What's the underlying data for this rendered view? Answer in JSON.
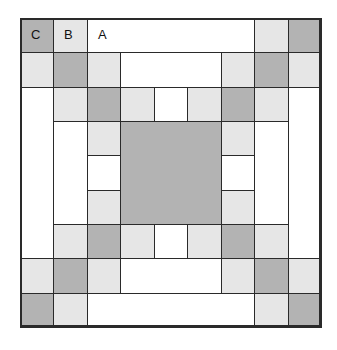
{
  "colors": {
    "dark": "#b3b3b3",
    "light": "#e6e6e6",
    "white": "#ffffff",
    "line": "#2a2a2a"
  },
  "grid": {
    "cols": 9,
    "rows": 9,
    "origin_x": 20,
    "origin_y": 18,
    "cell_w": 33.45,
    "cell_h": 34.33
  },
  "labels": {
    "C": "C",
    "B": "B",
    "A": "A"
  },
  "pieces": [
    {
      "c": 0,
      "r": 0,
      "w": 1,
      "h": 1,
      "t": "dark",
      "label": "C"
    },
    {
      "c": 1,
      "r": 0,
      "w": 1,
      "h": 1,
      "t": "light",
      "label": "B"
    },
    {
      "c": 2,
      "r": 0,
      "w": 5,
      "h": 1,
      "t": "white",
      "label": "A"
    },
    {
      "c": 7,
      "r": 0,
      "w": 1,
      "h": 1,
      "t": "light"
    },
    {
      "c": 8,
      "r": 0,
      "w": 1,
      "h": 1,
      "t": "dark"
    },
    {
      "c": 0,
      "r": 1,
      "w": 1,
      "h": 1,
      "t": "light"
    },
    {
      "c": 1,
      "r": 1,
      "w": 1,
      "h": 1,
      "t": "dark"
    },
    {
      "c": 2,
      "r": 1,
      "w": 1,
      "h": 1,
      "t": "light"
    },
    {
      "c": 3,
      "r": 1,
      "w": 3,
      "h": 1,
      "t": "white"
    },
    {
      "c": 6,
      "r": 1,
      "w": 1,
      "h": 1,
      "t": "light"
    },
    {
      "c": 7,
      "r": 1,
      "w": 1,
      "h": 1,
      "t": "dark"
    },
    {
      "c": 8,
      "r": 1,
      "w": 1,
      "h": 1,
      "t": "light"
    },
    {
      "c": 0,
      "r": 2,
      "w": 1,
      "h": 5,
      "t": "white"
    },
    {
      "c": 8,
      "r": 2,
      "w": 1,
      "h": 5,
      "t": "white"
    },
    {
      "c": 1,
      "r": 2,
      "w": 1,
      "h": 1,
      "t": "light"
    },
    {
      "c": 2,
      "r": 2,
      "w": 1,
      "h": 1,
      "t": "dark"
    },
    {
      "c": 3,
      "r": 2,
      "w": 1,
      "h": 1,
      "t": "light"
    },
    {
      "c": 4,
      "r": 2,
      "w": 1,
      "h": 1,
      "t": "white"
    },
    {
      "c": 5,
      "r": 2,
      "w": 1,
      "h": 1,
      "t": "light"
    },
    {
      "c": 6,
      "r": 2,
      "w": 1,
      "h": 1,
      "t": "dark"
    },
    {
      "c": 7,
      "r": 2,
      "w": 1,
      "h": 1,
      "t": "light"
    },
    {
      "c": 1,
      "r": 3,
      "w": 1,
      "h": 3,
      "t": "white"
    },
    {
      "c": 7,
      "r": 3,
      "w": 1,
      "h": 3,
      "t": "white"
    },
    {
      "c": 2,
      "r": 3,
      "w": 1,
      "h": 1,
      "t": "light"
    },
    {
      "c": 2,
      "r": 4,
      "w": 1,
      "h": 1,
      "t": "white"
    },
    {
      "c": 2,
      "r": 5,
      "w": 1,
      "h": 1,
      "t": "light"
    },
    {
      "c": 3,
      "r": 3,
      "w": 3,
      "h": 3,
      "t": "dark"
    },
    {
      "c": 6,
      "r": 3,
      "w": 1,
      "h": 1,
      "t": "light"
    },
    {
      "c": 6,
      "r": 4,
      "w": 1,
      "h": 1,
      "t": "white"
    },
    {
      "c": 6,
      "r": 5,
      "w": 1,
      "h": 1,
      "t": "light"
    },
    {
      "c": 1,
      "r": 6,
      "w": 1,
      "h": 1,
      "t": "light"
    },
    {
      "c": 2,
      "r": 6,
      "w": 1,
      "h": 1,
      "t": "dark"
    },
    {
      "c": 3,
      "r": 6,
      "w": 1,
      "h": 1,
      "t": "light"
    },
    {
      "c": 4,
      "r": 6,
      "w": 1,
      "h": 1,
      "t": "white"
    },
    {
      "c": 5,
      "r": 6,
      "w": 1,
      "h": 1,
      "t": "light"
    },
    {
      "c": 6,
      "r": 6,
      "w": 1,
      "h": 1,
      "t": "dark"
    },
    {
      "c": 7,
      "r": 6,
      "w": 1,
      "h": 1,
      "t": "light"
    },
    {
      "c": 0,
      "r": 7,
      "w": 1,
      "h": 1,
      "t": "light"
    },
    {
      "c": 1,
      "r": 7,
      "w": 1,
      "h": 1,
      "t": "dark"
    },
    {
      "c": 2,
      "r": 7,
      "w": 1,
      "h": 1,
      "t": "light"
    },
    {
      "c": 3,
      "r": 7,
      "w": 3,
      "h": 1,
      "t": "white"
    },
    {
      "c": 6,
      "r": 7,
      "w": 1,
      "h": 1,
      "t": "light"
    },
    {
      "c": 7,
      "r": 7,
      "w": 1,
      "h": 1,
      "t": "dark"
    },
    {
      "c": 8,
      "r": 7,
      "w": 1,
      "h": 1,
      "t": "light"
    },
    {
      "c": 0,
      "r": 8,
      "w": 1,
      "h": 1,
      "t": "dark"
    },
    {
      "c": 1,
      "r": 8,
      "w": 1,
      "h": 1,
      "t": "light"
    },
    {
      "c": 2,
      "r": 8,
      "w": 5,
      "h": 1,
      "t": "white"
    },
    {
      "c": 7,
      "r": 8,
      "w": 1,
      "h": 1,
      "t": "light"
    },
    {
      "c": 8,
      "r": 8,
      "w": 1,
      "h": 1,
      "t": "dark"
    }
  ]
}
